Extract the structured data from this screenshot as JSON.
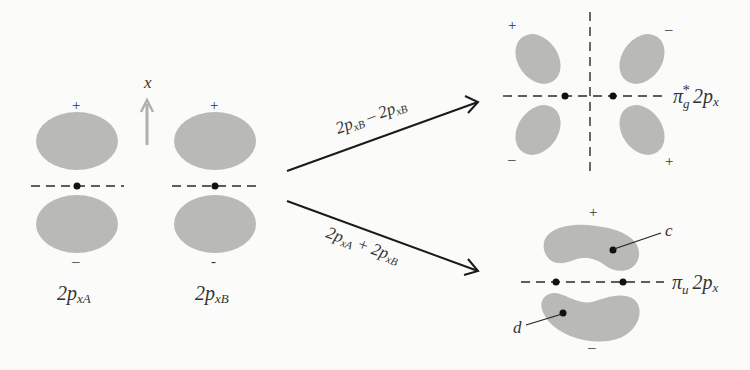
{
  "diagram": {
    "axis_label": "x",
    "atomic_orbitals": [
      {
        "id": "A",
        "label_main": "2p",
        "label_sub": "xA",
        "top_sign": "+",
        "bottom_sign": "–"
      },
      {
        "id": "B",
        "label_main": "2p",
        "label_sub": "xB",
        "top_sign": "+",
        "bottom_sign": "-"
      }
    ],
    "arrows": [
      {
        "id": "antibonding",
        "label": "2pₓʙ – 2pₓʙ",
        "label_a": "2p",
        "sub_a": "xB",
        "op": "–",
        "label_b": "2p",
        "sub_b": "xB"
      },
      {
        "id": "bonding",
        "label_a": "2p",
        "sub_a": "xA",
        "op": "+",
        "label_b": "2p",
        "sub_b": "xB"
      }
    ],
    "molecular_orbitals": [
      {
        "id": "pi-g-star",
        "label_greek": "π",
        "label_sub": "g",
        "label_sup": "*",
        "label_rest": "2p",
        "label_rest_sub": "x",
        "signs": {
          "top_left": "+",
          "top_right": "–",
          "bottom_left": "–",
          "bottom_right": "+"
        }
      },
      {
        "id": "pi-u",
        "label_greek": "π",
        "label_sub": "u",
        "label_rest": "2p",
        "label_rest_sub": "x",
        "signs": {
          "top": "+",
          "bottom": "–"
        },
        "points": [
          "c",
          "d"
        ]
      }
    ],
    "colors": {
      "lobe": "#b9b9b7",
      "line": "#1a1a1a",
      "background": "#fbfbfa",
      "axis_arrow": "#b0b0ae"
    }
  }
}
